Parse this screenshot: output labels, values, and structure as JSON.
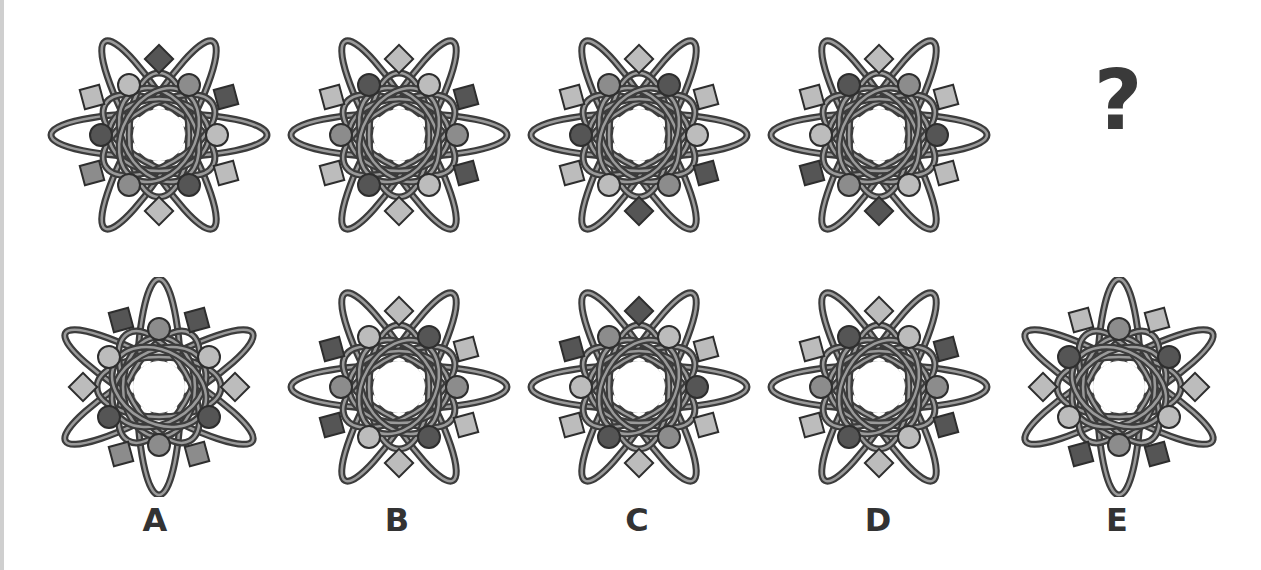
{
  "puzzle": {
    "question_mark": "?",
    "shades": {
      "dark": "#555555",
      "medium": "#8c8c8c",
      "light": "#bcbcbc"
    },
    "sequence": [
      {
        "id": "seq1",
        "orientation": "horizontal",
        "diamonds": {
          "top": "dark",
          "bottom": "light"
        },
        "squares": {
          "ul": "light",
          "ur": "dark",
          "ll": "medium",
          "lr": "light"
        },
        "circles": {
          "ul": "light",
          "ur": "medium",
          "l": "dark",
          "r": "light",
          "ll": "medium",
          "lr": "dark"
        }
      },
      {
        "id": "seq2",
        "orientation": "horizontal",
        "diamonds": {
          "top": "light",
          "bottom": "light"
        },
        "squares": {
          "ul": "light",
          "ur": "dark",
          "ll": "light",
          "lr": "dark"
        },
        "circles": {
          "ul": "dark",
          "ur": "light",
          "l": "medium",
          "r": "medium",
          "ll": "dark",
          "lr": "light"
        }
      },
      {
        "id": "seq3",
        "orientation": "horizontal",
        "diamonds": {
          "top": "light",
          "bottom": "dark"
        },
        "squares": {
          "ul": "light",
          "ur": "light",
          "ll": "light",
          "lr": "dark"
        },
        "circles": {
          "ul": "medium",
          "ur": "dark",
          "l": "dark",
          "r": "light",
          "ll": "light",
          "lr": "medium"
        }
      },
      {
        "id": "seq4",
        "orientation": "horizontal",
        "diamonds": {
          "top": "light",
          "bottom": "dark"
        },
        "squares": {
          "ul": "light",
          "ur": "light",
          "ll": "dark",
          "lr": "light"
        },
        "circles": {
          "ul": "dark",
          "ur": "medium",
          "l": "light",
          "r": "dark",
          "ll": "medium",
          "lr": "light"
        }
      }
    ],
    "options": [
      {
        "label": "A",
        "orientation": "vertical",
        "diamonds": {
          "left": "light",
          "right": "light"
        },
        "squares": {
          "tl": "dark",
          "tr": "dark",
          "bl": "medium",
          "br": "medium"
        },
        "circles": {
          "t": "medium",
          "ul": "light",
          "ur": "light",
          "ll": "dark",
          "lr": "dark",
          "b": "medium"
        }
      },
      {
        "label": "B",
        "orientation": "horizontal",
        "diamonds": {
          "top": "light",
          "bottom": "light"
        },
        "squares": {
          "ul": "dark",
          "ur": "light",
          "ll": "dark",
          "lr": "light"
        },
        "circles": {
          "ul": "light",
          "ur": "dark",
          "l": "medium",
          "r": "medium",
          "ll": "light",
          "lr": "dark"
        }
      },
      {
        "label": "C",
        "orientation": "horizontal",
        "diamonds": {
          "top": "dark",
          "bottom": "light"
        },
        "squares": {
          "ul": "dark",
          "ur": "light",
          "ll": "light",
          "lr": "light"
        },
        "circles": {
          "ul": "medium",
          "ur": "light",
          "l": "light",
          "r": "dark",
          "ll": "dark",
          "lr": "medium"
        }
      },
      {
        "label": "D",
        "orientation": "horizontal",
        "diamonds": {
          "top": "light",
          "bottom": "light"
        },
        "squares": {
          "ul": "light",
          "ur": "dark",
          "ll": "light",
          "lr": "dark"
        },
        "circles": {
          "ul": "dark",
          "ur": "light",
          "l": "medium",
          "r": "medium",
          "ll": "dark",
          "lr": "light"
        }
      },
      {
        "label": "E",
        "orientation": "vertical",
        "diamonds": {
          "left": "light",
          "right": "light"
        },
        "squares": {
          "tl": "light",
          "tr": "light",
          "bl": "dark",
          "br": "dark"
        },
        "circles": {
          "t": "medium",
          "ul": "dark",
          "ur": "dark",
          "ll": "light",
          "lr": "light",
          "b": "medium"
        }
      }
    ]
  }
}
